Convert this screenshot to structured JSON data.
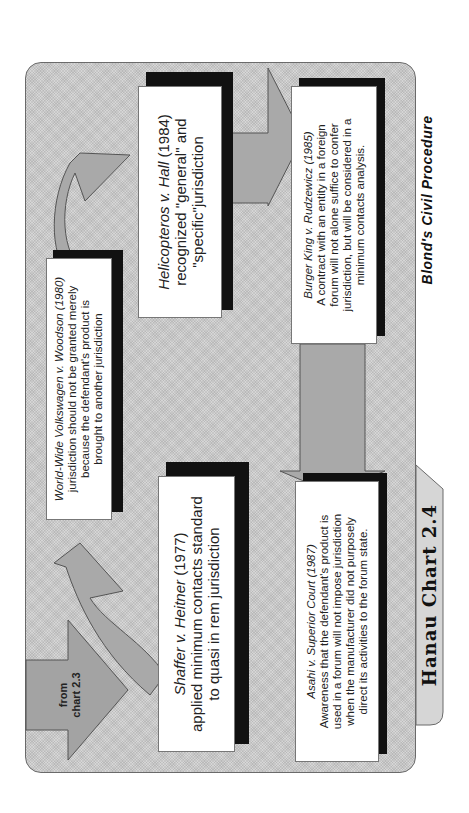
{
  "colors": {
    "panel_fill": "#d6d6d6",
    "arrow_fill": "#a9a9a9",
    "from_arrow_fill": "#a3a3a3",
    "box_fill": "#ffffff",
    "shadow": "#111111"
  },
  "diagram": {
    "tab_title": "Hanau Chart 2.4",
    "footer": "Blond's Civil Procedure",
    "from_arrow": {
      "line1": "from",
      "line2": "chart 2.3"
    },
    "boxes": {
      "shaffer": {
        "case": "Shaffer v. Heitner",
        "year": " (1977)",
        "lines": [
          "applied minimum contacts standard",
          "to quasi in rem jurisdiction"
        ]
      },
      "wwv": {
        "case": "World-Wide Volkswagen v. Woodson (1980)",
        "lines": [
          "jurisdiction should not be granted merely",
          "because the defendant's product is",
          "brought to another jurisdiction"
        ]
      },
      "helicopteros": {
        "case": "Helicopteros v. Hall",
        "year": " (1984)",
        "lines": [
          "recognized \"general\" and",
          "\"specific\"jurisdiction"
        ]
      },
      "burger_king": {
        "case": "Burger King v. Rudzewicz (1985)",
        "lines": [
          "A contract with an entity in a foreign",
          "forum will not alone suffice to confer",
          "jurisdiction, but will be considered in a",
          "minimum contacts analysis."
        ]
      },
      "asahi": {
        "case": "Asahi v. Superior Court (1987)",
        "lines": [
          "Awareness that the defendant's product is",
          "used in a forum will not impose jurisdiction",
          "when the manufacturer did not purposely",
          "direct its activities to the forum state."
        ]
      }
    },
    "arrows": [
      {
        "name": "from-chart-arrow",
        "from": "chart 2.3",
        "to": "Shaffer v. Heitner"
      },
      {
        "name": "curved-arrow-1",
        "from": "Shaffer v. Heitner",
        "to": "World-Wide Volkswagen v. Woodson"
      },
      {
        "name": "curved-arrow-2",
        "from": "World-Wide Volkswagen v. Woodson",
        "to": "Helicopteros v. Hall"
      },
      {
        "name": "straight-arrow-1",
        "from": "Helicopteros v. Hall",
        "to": "Burger King v. Rudzewicz"
      },
      {
        "name": "straight-arrow-2",
        "from": "Burger King v. Rudzewicz",
        "to": "Asahi v. Superior Court"
      }
    ]
  }
}
